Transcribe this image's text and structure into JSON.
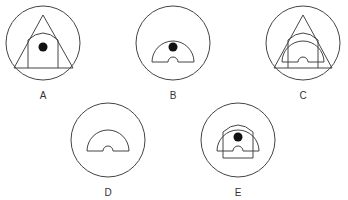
{
  "figure": {
    "type": "visual-reasoning-options",
    "options": [
      {
        "label": "A",
        "description": "Circle containing a triangle, with an arch (rectangle with domed top) inside and a black dot"
      },
      {
        "label": "B",
        "description": "Circle containing a semicircular half-ring shape with a small notch at base and a black dot"
      },
      {
        "label": "C",
        "description": "Circle containing a triangle, an arch and a semicircular half-ring with notch, no dot"
      },
      {
        "label": "D",
        "description": "Circle containing a semicircular half-ring with a notch, no dot"
      },
      {
        "label": "E",
        "description": "Circle containing an arch overlapping a half-ring with notch and a black dot"
      }
    ]
  },
  "colors": {
    "stroke": "#444444",
    "dot": "#111111",
    "background": "#ffffff"
  }
}
